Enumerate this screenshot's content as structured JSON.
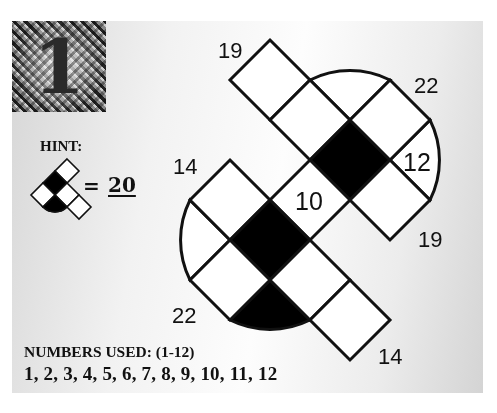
{
  "puzzle": {
    "number": "1",
    "hint": {
      "label": "HINT:",
      "equals": "=",
      "value": "20"
    },
    "numbers_used": {
      "label": "NUMBERS USED:  (1-12)",
      "list": "1, 2, 3, 4, 5, 6, 7, 8, 9, 10, 11, 12"
    },
    "clues": {
      "top_left_19": "19",
      "top_right_22": "22",
      "right_12": "12",
      "right_19": "19",
      "center_10": "10",
      "left_14": "14",
      "bottom_left_22": "22",
      "bottom_right_14": "14"
    },
    "colors": {
      "filled_cell": "#000000",
      "empty_cell": "#ffffff",
      "grid_line": "#111111"
    }
  }
}
